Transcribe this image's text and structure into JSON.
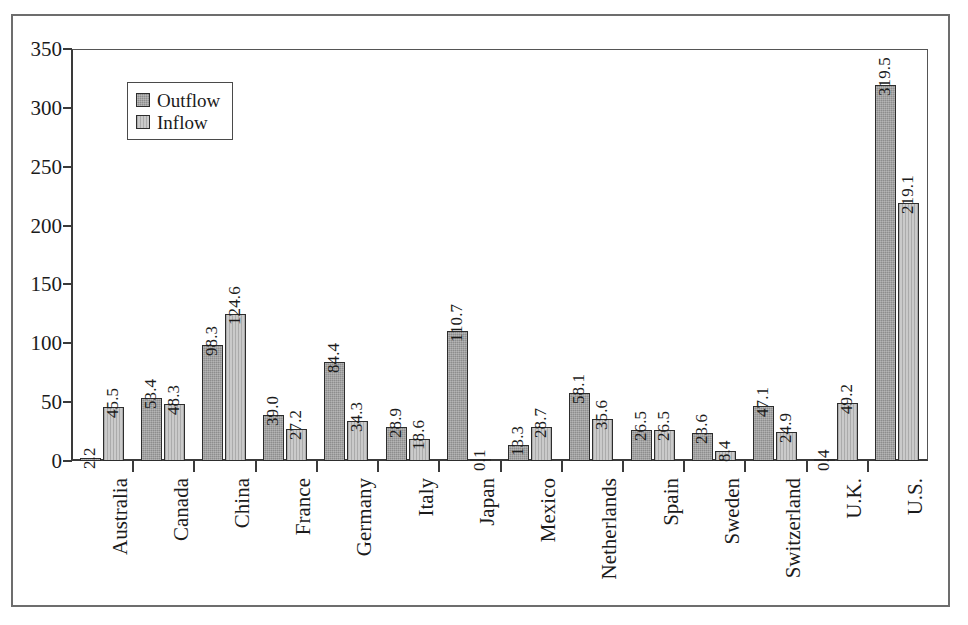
{
  "chart_data": {
    "type": "bar",
    "title": "",
    "subtitle": "",
    "xlabel": "",
    "ylabel": "",
    "ylim": [
      0,
      350
    ],
    "y_ticks": [
      0,
      50,
      100,
      150,
      200,
      250,
      300,
      350
    ],
    "grid": false,
    "legend_position": "top-left",
    "categories": [
      "Australia",
      "Canada",
      "China",
      "France",
      "Germany",
      "Italy",
      "Japan",
      "Mexico",
      "Netherlands",
      "Spain",
      "Sweden",
      "Switzerland",
      "U.K.",
      "U.S."
    ],
    "series": [
      {
        "name": "Outflow",
        "color": "#8d8d8d",
        "values": [
          2.2,
          53.4,
          98.3,
          39.0,
          84.4,
          28.9,
          110.7,
          13.3,
          58.1,
          26.5,
          23.6,
          47.1,
          0.4,
          319.5
        ],
        "labels": [
          "2.2",
          "53.4",
          "98.3",
          "39.0",
          "84.4",
          "28.9",
          "110.7",
          "13.3",
          "58.1",
          "26.5",
          "23.6",
          "47.1",
          "0.4",
          "319.5"
        ]
      },
      {
        "name": "Inflow",
        "color": "#cacaca",
        "values": [
          45.5,
          48.3,
          124.6,
          27.2,
          34.3,
          18.6,
          0.1,
          28.7,
          35.6,
          26.5,
          8.4,
          24.9,
          49.2,
          219.1
        ],
        "labels": [
          "45.5",
          "48.3",
          "124.6",
          "27.2",
          "34.3",
          "18.6",
          "0.1",
          "28.7",
          "35.6",
          "26.5",
          "8.4",
          "24.9",
          "49.2",
          "219.1"
        ]
      }
    ]
  },
  "legend": {
    "items": [
      {
        "label": "Outflow",
        "swatch": "outflow-swatch"
      },
      {
        "label": "Inflow",
        "swatch": "inflow-swatch"
      }
    ]
  },
  "axes": {
    "y_tick_labels": [
      "0",
      "50",
      "100",
      "150",
      "200",
      "250",
      "300",
      "350"
    ]
  }
}
